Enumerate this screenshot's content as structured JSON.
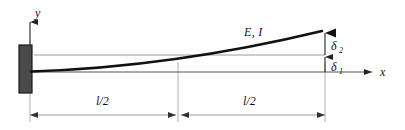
{
  "figure": {
    "type": "engineering-diagram",
    "background_color": "#ffffff"
  },
  "axes": {
    "y_label": "y",
    "x_label": "x",
    "axis_color": "#555555",
    "origin_x": 30,
    "origin_y": 72
  },
  "support": {
    "name": "fixed-support-block",
    "fill_color": "#4a4a4a",
    "stroke_color": "#1a1a1a"
  },
  "beam": {
    "label": "E, I",
    "curve_color": "#111111",
    "tip_deflection_label": "deflected-beam-curve"
  },
  "deflections": [
    {
      "name": "delta-2",
      "symbol": "δ",
      "subscript": "2"
    },
    {
      "name": "delta-1",
      "symbol": "δ",
      "subscript": "1"
    }
  ],
  "dimensions": [
    {
      "name": "left-half-span",
      "label": "l/2"
    },
    {
      "name": "right-half-span",
      "label": "l/2"
    }
  ],
  "style": {
    "dimension_line_color": "#9a9a9a",
    "extension_line_color": "#b0b0b0",
    "reference_line_color": "#9a9a9a"
  }
}
